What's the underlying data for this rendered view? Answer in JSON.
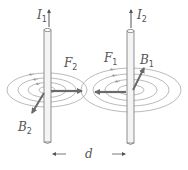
{
  "diagram": {
    "labels": {
      "current_1": {
        "main": "I",
        "sub": "1"
      },
      "current_2": {
        "main": "I",
        "sub": "2"
      },
      "force_1": {
        "main": "F",
        "sub": "1"
      },
      "force_2": {
        "main": "F",
        "sub": "2"
      },
      "field_1": {
        "main": "B",
        "sub": "1"
      },
      "field_2": {
        "main": "B",
        "sub": "2"
      },
      "distance": "d"
    },
    "colors": {
      "wire_stroke": "#777777",
      "field_lines": "#a0a0a0",
      "vector_arrows": "#6a6a6a",
      "text": "#555555"
    }
  }
}
